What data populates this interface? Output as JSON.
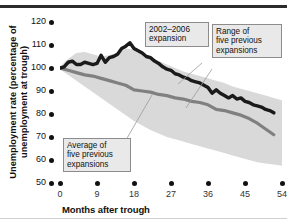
{
  "chart_data": {
    "type": "area",
    "title": "",
    "xlabel": "Months after trough",
    "ylabel": "Unemployment rate (percentage\nof unemployment at trough)",
    "xlim": [
      0,
      54
    ],
    "ylim": [
      50,
      120
    ],
    "xticks": [
      "0",
      "9",
      "18",
      "27",
      "36",
      "45",
      "54"
    ],
    "yticks": [
      "120",
      "110",
      "100",
      "90",
      "80",
      "70",
      "60",
      "50"
    ],
    "grid": false,
    "legend_position": "annotations-inline",
    "annotations": [
      {
        "id": "expansion-2002",
        "label": "2002–2006\nexpansion"
      },
      {
        "id": "range-previous",
        "label": "Range of\nfive previous\nexpansions"
      },
      {
        "id": "average-previous",
        "label": "Average of\nfive previous\nexpansions"
      }
    ],
    "colors": {
      "current_line": "#1a1a1a",
      "average_line": "#808080",
      "range_band": "#d9d9d9",
      "annotation_box": "#e9e9e9",
      "annotation_border": "#8c8c8c",
      "axis_text": "#111111"
    },
    "series": [
      {
        "name": "Range of five previous expansions (upper bound)",
        "x": [
          0,
          2,
          4,
          6,
          8,
          10,
          12,
          14,
          16,
          18,
          20,
          22,
          24,
          26,
          28,
          30,
          32,
          34,
          36,
          38,
          40,
          42,
          44,
          46,
          48,
          50,
          52,
          54
        ],
        "values": [
          100.5,
          104.0,
          106.5,
          107.0,
          106.0,
          105.0,
          105.5,
          106.5,
          108.5,
          108.0,
          106.0,
          104.5,
          103.0,
          101.5,
          100.0,
          98.5,
          97.5,
          96.5,
          95.5,
          94.5,
          93.5,
          92.0,
          91.0,
          90.0,
          89.0,
          88.0,
          87.0,
          86.0
        ]
      },
      {
        "name": "Range of five previous expansions (lower bound)",
        "x": [
          0,
          2,
          4,
          6,
          8,
          10,
          12,
          14,
          16,
          18,
          20,
          22,
          24,
          26,
          28,
          30,
          32,
          34,
          36,
          38,
          40,
          42,
          44,
          46,
          48,
          50,
          52,
          54
        ],
        "values": [
          99.5,
          97.0,
          94.5,
          92.0,
          89.5,
          87.0,
          84.5,
          82.0,
          79.5,
          77.0,
          75.0,
          73.0,
          71.5,
          70.0,
          69.0,
          68.0,
          67.0,
          66.0,
          65.0,
          64.0,
          63.0,
          62.0,
          61.0,
          60.0,
          59.0,
          58.5,
          58.0,
          57.5
        ]
      },
      {
        "name": "2002–2006 expansion",
        "x": [
          0,
          1,
          2,
          3,
          4,
          5,
          6,
          7,
          8,
          9,
          10,
          11,
          12,
          13,
          14,
          15,
          16,
          17,
          18,
          19,
          20,
          21,
          22,
          23,
          24,
          25,
          26,
          27,
          28,
          29,
          30,
          31,
          32,
          33,
          34,
          35,
          36,
          37,
          38,
          39,
          40,
          41,
          42,
          43,
          44,
          45,
          46,
          47,
          48,
          49,
          50,
          51,
          52
        ],
        "values": [
          100,
          100.5,
          102.5,
          103.0,
          101.5,
          101.5,
          102.5,
          102.0,
          101.5,
          102.0,
          105.5,
          102.5,
          104.5,
          105.0,
          106.0,
          108.5,
          109.5,
          111.0,
          108.5,
          107.5,
          106.5,
          105.0,
          104.5,
          103.0,
          102.0,
          100.5,
          99.5,
          99.0,
          97.5,
          97.0,
          96.0,
          95.5,
          94.5,
          94.0,
          93.5,
          92.5,
          91.5,
          89.0,
          90.5,
          89.0,
          88.0,
          87.0,
          88.0,
          86.5,
          87.0,
          85.5,
          85.0,
          84.0,
          83.5,
          83.0,
          82.0,
          81.5,
          80.5
        ]
      },
      {
        "name": "Average of five previous expansions",
        "x": [
          0,
          2,
          4,
          6,
          8,
          10,
          12,
          14,
          16,
          18,
          20,
          22,
          24,
          26,
          28,
          30,
          32,
          34,
          36,
          38,
          40,
          42,
          44,
          46,
          48,
          50,
          52
        ],
        "values": [
          100,
          99.0,
          98.0,
          97.0,
          96.5,
          95.5,
          94.5,
          93.5,
          92.5,
          90.5,
          90.0,
          89.5,
          88.5,
          88.0,
          87.0,
          86.5,
          85.5,
          85.0,
          84.0,
          82.0,
          81.5,
          80.5,
          79.5,
          78.0,
          76.0,
          73.5,
          71.0
        ]
      }
    ]
  }
}
